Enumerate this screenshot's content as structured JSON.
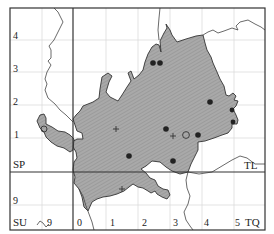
{
  "map": {
    "type": "distribution-map",
    "colors": {
      "fill": "#a8a8a8",
      "hatch": "#8c8c8c",
      "outline": "#333333",
      "grid": "#dddddd",
      "frame": "#333333",
      "dot": "#222222"
    },
    "grid_squares": {
      "top_left": "",
      "SP": "SP",
      "TL": "TL",
      "SU": "SU",
      "TQ": "TQ"
    },
    "y_labels_left": [
      "4",
      "3",
      "2",
      "1",
      "9"
    ],
    "x_labels_bottom": [
      "9",
      "0",
      "1",
      "2",
      "3",
      "4",
      "5"
    ],
    "records": {
      "solid_dots": [
        {
          "x": 153,
          "y": 63
        },
        {
          "x": 159,
          "y": 63
        },
        {
          "x": 210,
          "y": 102
        },
        {
          "x": 232,
          "y": 110
        },
        {
          "x": 166,
          "y": 129
        },
        {
          "x": 198,
          "y": 135
        },
        {
          "x": 233,
          "y": 122
        },
        {
          "x": 129,
          "y": 156
        },
        {
          "x": 173,
          "y": 161
        },
        {
          "x": 236,
          "y": 131
        }
      ],
      "open_circles": [
        {
          "x": 186,
          "y": 135
        },
        {
          "x": 44,
          "y": 129
        }
      ],
      "crosses": [
        {
          "x": 116,
          "y": 129
        },
        {
          "x": 173,
          "y": 136
        },
        {
          "x": 122,
          "y": 189
        }
      ]
    }
  }
}
